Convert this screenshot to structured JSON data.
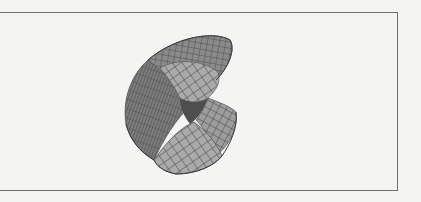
{
  "figure": {
    "kind": "3d-surface-mesh",
    "colors": {
      "surface_light": "#a9a9a9",
      "surface_mid": "#8e8e8e",
      "surface_dark": "#626262",
      "mesh_line": "#3e3e3e",
      "frame_border": "#6f6f6f",
      "paper": "#f4f4f3"
    }
  }
}
